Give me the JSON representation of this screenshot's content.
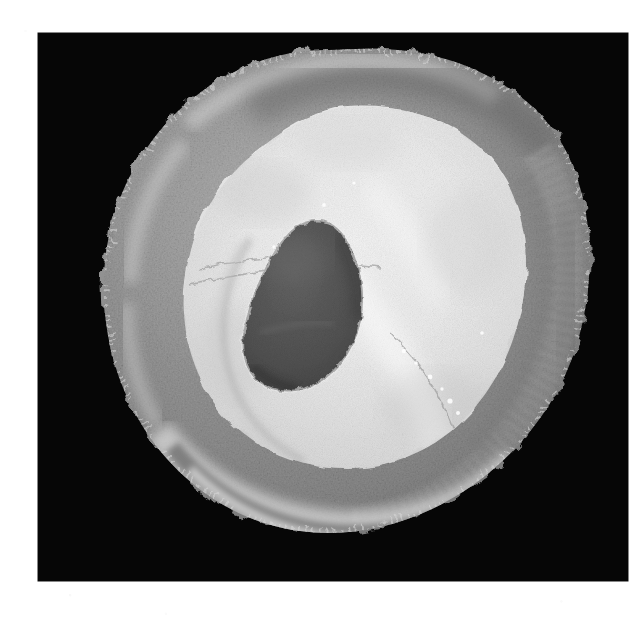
{
  "page": {
    "kind": "scanned-photographic-plate",
    "background_color": "#ffffff",
    "width_px": 638,
    "height_px": 620,
    "caption_text": "",
    "figure_number_text": "",
    "margin_note_text": ""
  },
  "plate": {
    "label": "photographic plate",
    "background_color": "#060606",
    "left_px": 38,
    "top_px": 33,
    "width_px": 590,
    "height_px": 548
  },
  "specimen": {
    "label": "specimen cross-section",
    "description": "Rounded, irregularly lobulated cut surface of a specimen photographed against a black background.",
    "colors": {
      "outer_rim": "#8f8f8f",
      "outer_rim_light": "#c4c4c4",
      "outer_rim_dark": "#6a6a6a",
      "inner_core": "#e9e9e9",
      "inner_core_bright": "#f6f6f6",
      "inner_core_shadow": "#bdbdbd",
      "central_lesion": "#555555",
      "central_lesion_dark": "#3f3f3f",
      "background": "#060606"
    },
    "regions": [
      {
        "name": "outer-rim",
        "tone": "mid-gray",
        "note": "Granular, crenated peripheral zone forming the outer ring of the cut face."
      },
      {
        "name": "inner-core",
        "tone": "near-white",
        "note": "Large pale lobulated central mass occupying most of the cut face."
      },
      {
        "name": "central-lesion",
        "tone": "dark-gray",
        "note": "Teardrop / ovoid dark cavity set slightly left and below center of the pale core."
      },
      {
        "name": "lower-band",
        "tone": "gray",
        "note": "Curved darker band sweeping across the lower portion of the specimen."
      }
    ],
    "geometry": {
      "outline_center_px": [
        335,
        327
      ],
      "outline_radius_x_px": 222,
      "outline_radius_y_px": 198,
      "core_center_px": [
        335,
        335
      ],
      "lesion_center_px": [
        305,
        395
      ],
      "lesion_width_px": 112,
      "lesion_height_px": 135
    }
  }
}
